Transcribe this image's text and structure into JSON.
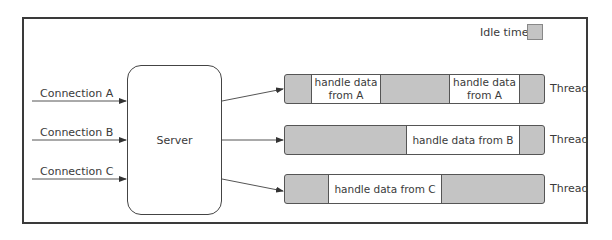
{
  "diagram": {
    "legend": {
      "label": "Idle time",
      "idle_color": "#c4c4c4"
    },
    "server": {
      "label": "Server"
    },
    "connections": [
      {
        "label": "Connection A"
      },
      {
        "label": "Connection B"
      },
      {
        "label": "Connection C"
      }
    ],
    "threads": [
      {
        "label": "Thread",
        "segments": [
          {
            "type": "idle"
          },
          {
            "type": "work",
            "text": "handle data from A"
          },
          {
            "type": "idle"
          },
          {
            "type": "work",
            "text": "handle data from A"
          },
          {
            "type": "idle"
          }
        ]
      },
      {
        "label": "Thread",
        "segments": [
          {
            "type": "idle"
          },
          {
            "type": "work",
            "text": "handle data from B"
          },
          {
            "type": "idle"
          }
        ]
      },
      {
        "label": "Thread",
        "segments": [
          {
            "type": "idle"
          },
          {
            "type": "work",
            "text": "handle data from C"
          },
          {
            "type": "idle"
          }
        ]
      }
    ]
  }
}
